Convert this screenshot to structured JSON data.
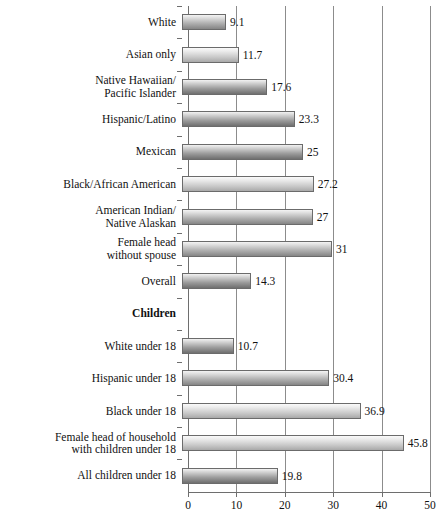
{
  "chart_data": {
    "type": "bar",
    "orientation": "horizontal",
    "title": "",
    "xlabel": "",
    "ylabel": "",
    "xlim": [
      0,
      50
    ],
    "xticks": [
      0,
      10,
      20,
      30,
      40,
      50
    ],
    "grid": true,
    "legend": false,
    "categories": [
      "White",
      "Asian only",
      "Native Hawaiian/\nPacific Islander",
      "Hispanic/Latino",
      "Mexican",
      "Black/African American",
      "American Indian/\nNative Alaskan",
      "Female head\nwithout spouse",
      "Overall",
      "Children",
      "White under 18",
      "Hispanic under 18",
      "Black under 18",
      "Female head of household\nwith children under 18",
      "All children under 18"
    ],
    "values": [
      9.1,
      11.7,
      17.6,
      23.3,
      25,
      27.2,
      27,
      31,
      14.3,
      null,
      10.7,
      30.4,
      36.9,
      45.8,
      19.8
    ],
    "rows": [
      {
        "label": "White",
        "value": 9.1,
        "value_label": "9.1",
        "section": false,
        "shade": "mid"
      },
      {
        "label": "Asian only",
        "value": 11.7,
        "value_label": "11.7",
        "section": false,
        "shade": "light"
      },
      {
        "label": "Native Hawaiian/\nPacific Islander",
        "value": 17.6,
        "value_label": "17.6",
        "section": false,
        "shade": "default"
      },
      {
        "label": "Hispanic/Latino",
        "value": 23.3,
        "value_label": "23.3",
        "section": false,
        "shade": "default"
      },
      {
        "label": "Mexican",
        "value": 25,
        "value_label": "25",
        "section": false,
        "shade": "default"
      },
      {
        "label": "Black/African American",
        "value": 27.2,
        "value_label": "27.2",
        "section": false,
        "shade": "light"
      },
      {
        "label": "American Indian/\nNative Alaskan",
        "value": 27,
        "value_label": "27",
        "section": false,
        "shade": "mid"
      },
      {
        "label": "Female head\nwithout spouse",
        "value": 31,
        "value_label": "31",
        "section": false,
        "shade": "mid"
      },
      {
        "label": "Overall",
        "value": 14.3,
        "value_label": "14.3",
        "section": false,
        "shade": "default"
      },
      {
        "label": "Children",
        "value": null,
        "value_label": "",
        "section": true,
        "shade": "none"
      },
      {
        "label": "White under 18",
        "value": 10.7,
        "value_label": "10.7",
        "section": false,
        "shade": "default"
      },
      {
        "label": "Hispanic under 18",
        "value": 30.4,
        "value_label": "30.4",
        "section": false,
        "shade": "mid"
      },
      {
        "label": "Black under 18",
        "value": 36.9,
        "value_label": "36.9",
        "section": false,
        "shade": "light"
      },
      {
        "label": "Female head of household\nwith children under 18",
        "value": 45.8,
        "value_label": "45.8",
        "section": false,
        "shade": "light"
      },
      {
        "label": "All children under 18",
        "value": 19.8,
        "value_label": "19.8",
        "section": false,
        "shade": "default"
      }
    ],
    "xtick_labels": [
      "0",
      "10",
      "20",
      "30",
      "40",
      "50"
    ]
  }
}
